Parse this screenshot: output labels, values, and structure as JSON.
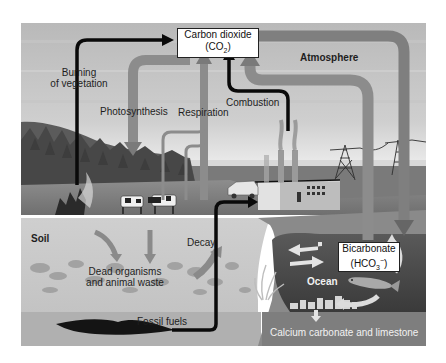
{
  "diagram": {
    "colors": {
      "sky_top": "#bdbdbd",
      "sky_bottom": "#e4e4e4",
      "pipe": "#8c8c8c",
      "pipe_dark": "#6e6e6e",
      "black_arrow": "#0a0a0a",
      "soil": "#c9c9c9",
      "soil_debris": "#9a9a9a",
      "fossil_layer": "#b3b3b3",
      "ocean": "#4a4a4a",
      "ocean_floor": "#8a8a8a",
      "forest": "#555555"
    },
    "nodes": {
      "co2": {
        "line1": "Carbon dioxide",
        "line2_prefix": "(CO",
        "line2_sub": "2",
        "line2_suffix": ")"
      },
      "bicarbonate": {
        "line1": "Bicarbonate",
        "line2_prefix": "(HCO",
        "line2_sub": "3",
        "line2_sup": "−",
        "line2_suffix": ")"
      }
    },
    "labels": {
      "burning_line1": "Burning",
      "burning_line2": "of vegetation",
      "photosynthesis": "Photosynthesis",
      "respiration": "Respiration",
      "combustion": "Combustion",
      "atmosphere": "Atmosphere",
      "soil": "Soil",
      "dead_line1": "Dead organisms",
      "dead_line2": "and animal waste",
      "decay": "Decay",
      "fossil_fuels": "Fossil fuels",
      "ocean": "Ocean",
      "calcium": "Calcium carbonate and limestone"
    },
    "flows": [
      {
        "from": "Burning of vegetation",
        "to": "Carbon dioxide (CO2)",
        "style": "black"
      },
      {
        "from": "Carbon dioxide (CO2)",
        "to": "Plants",
        "label": "Photosynthesis",
        "style": "gray"
      },
      {
        "from": "Plants and animals",
        "to": "Carbon dioxide (CO2)",
        "label": "Respiration",
        "style": "gray"
      },
      {
        "from": "Factory",
        "to": "Carbon dioxide (CO2)",
        "label": "Combustion",
        "style": "black"
      },
      {
        "from": "Ocean",
        "to": "Carbon dioxide (CO2)",
        "style": "gray"
      },
      {
        "from": "Carbon dioxide (CO2)",
        "to": "Bicarbonate (HCO3-)",
        "style": "gray"
      },
      {
        "from": "Fossil fuels",
        "to": "Factory",
        "style": "black"
      },
      {
        "from": "Dead organisms and animal waste",
        "to": "Atmosphere",
        "label": "Decay",
        "style": "gray"
      }
    ]
  }
}
